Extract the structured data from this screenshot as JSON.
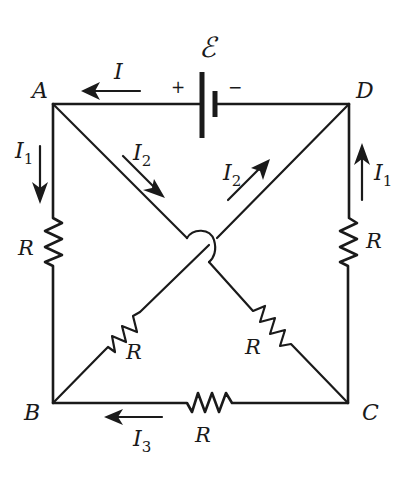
{
  "diagram": {
    "type": "circuit",
    "nodes": {
      "A": "A",
      "B": "B",
      "C": "C",
      "D": "D"
    },
    "battery": {
      "symbol": "ℰ",
      "plus": "+",
      "minus": "−"
    },
    "resistors": {
      "left_AB": "R",
      "right_DC": "R",
      "bottom_BC": "R",
      "diag_B_to_D": "R",
      "diag_A_to_C": "R"
    },
    "currents": {
      "top": {
        "symbol": "I",
        "sub": "",
        "direction": "left"
      },
      "left": {
        "symbol": "I",
        "sub": "1",
        "direction": "down"
      },
      "right": {
        "symbol": "I",
        "sub": "1",
        "direction": "up"
      },
      "diag_A": {
        "symbol": "I",
        "sub": "2",
        "direction": "down-right"
      },
      "diag_D": {
        "symbol": "I",
        "sub": "2",
        "direction": "up-right"
      },
      "bottom": {
        "symbol": "I",
        "sub": "3",
        "direction": "left"
      }
    },
    "colors": {
      "ink": "#1a1a1a",
      "background": "#ffffff"
    }
  }
}
